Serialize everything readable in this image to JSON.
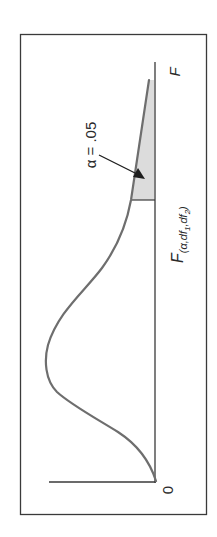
{
  "figure": {
    "type": "F-distribution density curve (rotated 90 degrees)",
    "labels": {
      "origin": "0",
      "x_axis": "F",
      "alpha": "α = .05",
      "critical_value_main": "F",
      "critical_value_subscript": "(α,df",
      "critical_value_sub1": "1",
      "critical_value_mid": ",df",
      "critical_value_sub2": "2",
      "critical_value_close": ")"
    },
    "colors": {
      "frame": "#3a3a3a",
      "axis": "#3a3a3a",
      "curve": "#6e6e6e",
      "shaded_region": "#dcdcdc",
      "arrow": "#1e1e1e",
      "text": "#2a2a2a"
    }
  }
}
